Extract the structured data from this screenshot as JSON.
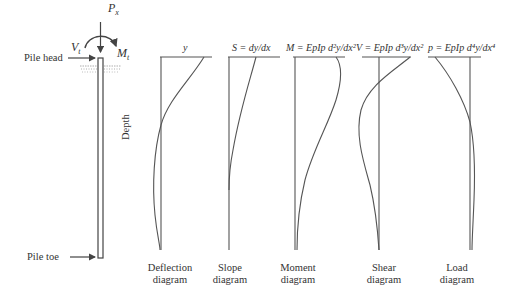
{
  "pile": {
    "head_label": "Pile head",
    "toe_label": "Pile toe",
    "axial_load_label": "P_x",
    "shear_load_label": "V_t",
    "moment_label": "M_t"
  },
  "depth_axis_label": "Depth",
  "diagrams": [
    {
      "equation": "y",
      "caption_line1": "Deflection",
      "caption_line2": "diagram"
    },
    {
      "equation": "S = dy/dx",
      "caption_line1": "Slope",
      "caption_line2": "diagram"
    },
    {
      "equation": "M = EpIp d²y/dx²",
      "caption_line1": "Moment",
      "caption_line2": "diagram"
    },
    {
      "equation": "V = EpIp d³y/dx²",
      "caption_line1": "Shear",
      "caption_line2": "diagram"
    },
    {
      "equation": "p = EpIp d⁴y/dx⁴",
      "caption_line1": "Load",
      "caption_line2": "diagram"
    }
  ],
  "colors": {
    "line": "#555555",
    "text": "#333333",
    "soil": "#888888"
  }
}
